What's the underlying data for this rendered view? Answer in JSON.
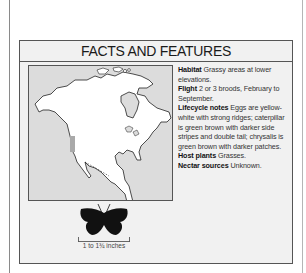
{
  "panel": {
    "title": "FACTS AND FEATURES"
  },
  "facts": [
    {
      "label": "Habitat",
      "text": "Grassy areas at lower elevations."
    },
    {
      "label": "Flight",
      "text": "2 or 3 broods, February to September."
    },
    {
      "label": "Lifecycle notes",
      "text": "Eggs are yellow-white with strong ridges; caterpillar is green brown with darker side stripes and double tail; chrysalis is green brown with darker patches."
    },
    {
      "label": "Host plants",
      "text": "Grasses."
    },
    {
      "label": "Nectar sources",
      "text": "Unknown."
    }
  ],
  "map": {
    "region": "North America",
    "range_color": "#a9a9a9",
    "land_color": "#ffffff",
    "sea_color": "#dcdcdc"
  },
  "size": {
    "label": "1 to 1¾ inches"
  }
}
